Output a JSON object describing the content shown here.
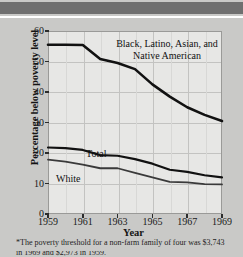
{
  "chart_data": {
    "type": "line",
    "title": "",
    "xlabel": "Year",
    "ylabel": "Percentage below poverty level",
    "xlim": [
      1959,
      1969
    ],
    "ylim": [
      0,
      60
    ],
    "grid": true,
    "legend_position": "inline-annotations",
    "x": [
      1959,
      1960,
      1961,
      1962,
      1963,
      1964,
      1965,
      1966,
      1967,
      1968,
      1969
    ],
    "xticks": [
      "1959",
      "1961",
      "1963",
      "1965",
      "1967",
      "1969"
    ],
    "yticks": [
      "0",
      "10",
      "20",
      "30",
      "40",
      "50",
      "60"
    ],
    "series": [
      {
        "name": "Black, Latino, Asian, and Native American",
        "values": [
          55.5,
          55.5,
          55.4,
          50.8,
          49.5,
          47.5,
          42.5,
          38.5,
          35.0,
          32.5,
          30.5
        ]
      },
      {
        "name": "Total",
        "values": [
          21.8,
          21.6,
          21.0,
          19.3,
          19.1,
          18.0,
          16.5,
          14.5,
          13.8,
          12.7,
          12.0
        ]
      },
      {
        "name": "White",
        "values": [
          17.8,
          17.2,
          16.2,
          15.0,
          15.0,
          13.5,
          12.0,
          10.5,
          10.4,
          9.8,
          9.7
        ]
      }
    ],
    "annotations": [
      {
        "id": "minority",
        "text_line1": "Black, Latino, Asian, and",
        "text_line2": "Native American"
      },
      {
        "id": "total",
        "text": "Total"
      },
      {
        "id": "white",
        "text": "White"
      }
    ]
  },
  "footnote": {
    "line1": "*The poverty threshold for a non-farm family of four was  $3,743",
    "line2": "in 1969 and $2,973 in 1959."
  },
  "colors": {
    "header_bar": "#6f6f6f",
    "page_background": "#c9c9c7",
    "plot_background": "#e7e7e5",
    "axis": "#2c2c2c",
    "grid": "#c3c3c1",
    "series_minority": "#111111",
    "series_total": "#111111",
    "series_white": "#3a3a3a"
  }
}
